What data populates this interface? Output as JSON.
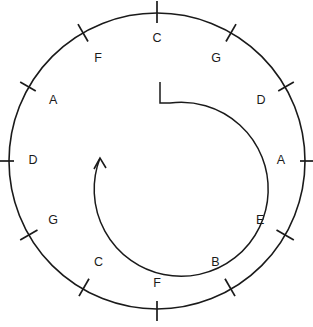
{
  "diagram": {
    "type": "radial-label-circle",
    "background_color": "#ffffff",
    "stroke_color": "#1a1a1a",
    "circle": {
      "center_x": 157,
      "center_y": 161,
      "radius": 148
    },
    "arrow": {
      "name": "clockwise-spiral-arrow",
      "direction": "clockwise",
      "tail_x": 160,
      "tail_y": 82,
      "head_x": 100,
      "head_y": 158,
      "radius": 79
    },
    "labels": [
      {
        "text": "C",
        "angle_deg": 0,
        "tick_inner": 138,
        "tick_outer": 160,
        "label_radius": 122
      },
      {
        "text": "G",
        "angle_deg": 30,
        "tick_inner": 138,
        "tick_outer": 158,
        "label_radius": 118
      },
      {
        "text": "D",
        "angle_deg": 60,
        "tick_inner": 140,
        "tick_outer": 158,
        "label_radius": 120
      },
      {
        "text": "A",
        "angle_deg": 90,
        "tick_inner": 143,
        "tick_outer": 162,
        "label_radius": 124
      },
      {
        "text": "E",
        "angle_deg": 120,
        "tick_inner": 138,
        "tick_outer": 158,
        "label_radius": 119
      },
      {
        "text": "B",
        "angle_deg": 150,
        "tick_inner": 136,
        "tick_outer": 156,
        "label_radius": 117
      },
      {
        "text": "F",
        "angle_deg": 180,
        "tick_inner": 140,
        "tick_outer": 160,
        "label_radius": 123
      },
      {
        "text": "C",
        "angle_deg": 210,
        "tick_inner": 136,
        "tick_outer": 156,
        "label_radius": 117
      },
      {
        "text": "G",
        "angle_deg": 240,
        "tick_inner": 138,
        "tick_outer": 158,
        "label_radius": 120
      },
      {
        "text": "D",
        "angle_deg": 270,
        "tick_inner": 143,
        "tick_outer": 162,
        "label_radius": 124
      },
      {
        "text": "A",
        "angle_deg": 300,
        "tick_inner": 140,
        "tick_outer": 158,
        "label_radius": 120
      },
      {
        "text": "F",
        "angle_deg": 330,
        "tick_inner": 138,
        "tick_outer": 158,
        "label_radius": 118
      }
    ]
  }
}
